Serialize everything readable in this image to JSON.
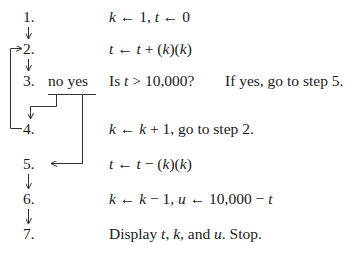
{
  "steps": [
    {
      "number": "1.",
      "text": "k ← 1, t ← 0"
    },
    {
      "number": "2.",
      "text": "t ← t + (k)(k)"
    },
    {
      "number": "3.",
      "text": "Is t > 10,000?"
    },
    {
      "number": "4.",
      "text": "k ← k + 1, go to step 2."
    },
    {
      "number": "5.",
      "text": "t ← t − (k)(k)"
    },
    {
      "number": "6.",
      "text": "k ← k − 1,    u ← 10,000 − t"
    },
    {
      "number": "7.",
      "text": "Display t, k, and u. Stop."
    }
  ],
  "decision": {
    "no_label": "no",
    "yes_label": "yes",
    "hint": "If yes, go to step 5."
  },
  "connectors": [
    {
      "from": "1",
      "to": "2",
      "type": "down-arrow"
    },
    {
      "from": "2",
      "to": "3",
      "type": "down-arrow"
    },
    {
      "from": "3",
      "to": "4",
      "type": "branch-no"
    },
    {
      "from": "3",
      "to": "5",
      "type": "branch-yes"
    },
    {
      "from": "4",
      "to": "2",
      "type": "loop-back"
    },
    {
      "from": "5",
      "to": "6",
      "type": "down-arrow"
    },
    {
      "from": "6",
      "to": "7",
      "type": "down-arrow"
    }
  ]
}
